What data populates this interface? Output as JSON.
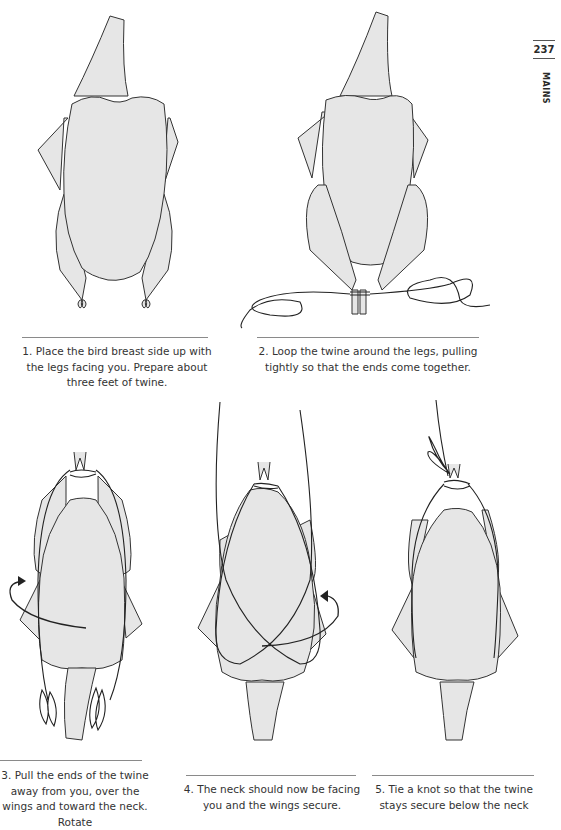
{
  "page": {
    "number": "237",
    "section": "MAINS"
  },
  "steps": [
    {
      "id": 1,
      "caption": "1. Place the bird breast side up with the legs facing you. Prepare about three feet of twine.",
      "icon": "chicken-untrussed-illustration"
    },
    {
      "id": 2,
      "caption": "2. Loop the twine around the legs, pulling tightly so that the ends come together.",
      "icon": "chicken-legs-tied-illustration"
    },
    {
      "id": 3,
      "caption": "3. Pull the ends of the twine away from you, over the wings and toward the neck. Rotate",
      "icon": "chicken-rotate-illustration"
    },
    {
      "id": 4,
      "caption": "4. The neck should now be facing you and the wings secure.",
      "icon": "chicken-crossed-twine-illustration"
    },
    {
      "id": 5,
      "caption": "5. Tie a knot so that the twine stays secure below the neck",
      "icon": "chicken-trussed-illustration"
    }
  ],
  "colors": {
    "fill": "#e6e6e6",
    "line": "#333333",
    "rule": "#8a8a8a"
  }
}
